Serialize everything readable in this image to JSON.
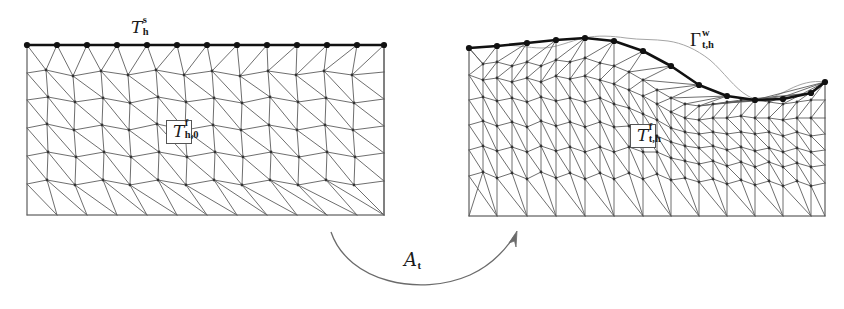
{
  "figure": {
    "kind": "mesh-deformation-diagram",
    "background": "#ffffff",
    "width": 844,
    "height": 309,
    "colors": {
      "mesh_line": "#5a5a5a",
      "mesh_border": "#9a9a9a",
      "boundary_curve": "#111111",
      "boundary_node": "#111111",
      "arrow": "#666666",
      "text": "#1a1a1a",
      "label_box_border": "#555555",
      "label_box_fill": "#ffffff"
    },
    "left_mesh": {
      "name": "reference-mesh",
      "top_label": {
        "symbol": "T",
        "superscript": "s",
        "subscript": "h",
        "text": "T_h^s"
      },
      "inner_label": {
        "symbol": "T",
        "superscript": "f",
        "subscript": "h,0",
        "text": "T_h,0^f"
      },
      "boundary_type": "flat",
      "boundary_node_count": 13,
      "bounds": {
        "x0": 27,
        "y0": 45,
        "x1": 384,
        "y1": 215
      }
    },
    "right_mesh": {
      "name": "deformed-mesh",
      "top_label": {
        "symbol": "Γ",
        "superscript": "w",
        "subscript": "t,h",
        "text": "Γ_t,h^w"
      },
      "inner_label": {
        "symbol": "T",
        "superscript": "f",
        "subscript": "t,h",
        "text": "T_t,h^f"
      },
      "boundary_type": "wavy",
      "boundary_node_count": 14,
      "bounds": {
        "x0": 469,
        "y0": 48,
        "x1": 825,
        "y1": 216
      }
    },
    "map_arrow": {
      "name": "deformation-map-arrow",
      "label": {
        "symbol": "A",
        "subscript": "t",
        "text": "A_t"
      },
      "direction": "left-to-right",
      "style": "curved-upward-arc"
    }
  }
}
